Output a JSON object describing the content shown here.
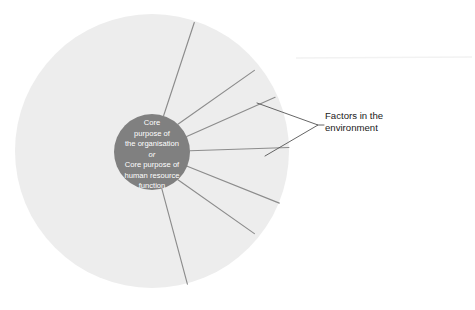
{
  "diagram": {
    "type": "radial-concept-diagram",
    "colors": {
      "outer_circle_fill": "#ededed",
      "inner_circle_fill": "#808080",
      "spoke_line": "#8c8c8c",
      "callout_line": "#555555",
      "core_text": "#ffffff",
      "label_text": "#1a1a1a",
      "background": "#ffffff",
      "artifact_line": "#f2f2f2"
    },
    "outer_circle": {
      "name": "environment-field",
      "cx": 152,
      "cy": 151,
      "r": 137
    },
    "inner_circle": {
      "name": "core-purpose-circle",
      "cx": 152,
      "cy": 152,
      "r": 38
    },
    "core_label": {
      "lines": [
        {
          "text": "Core",
          "italic": false
        },
        {
          "text": "purpose of",
          "italic": false
        },
        {
          "text": "the organisation",
          "italic": false
        },
        {
          "text": "or",
          "italic": true
        },
        {
          "text": "Core purpose of",
          "italic": false
        },
        {
          "text": "human resource",
          "italic": false
        },
        {
          "text": "function",
          "italic": false
        }
      ]
    },
    "spokes": [
      {
        "name": "spoke-1",
        "angle_deg": -72,
        "x1": 163.6,
        "y1": 115.8,
        "x2": 194.3,
        "y2": 22.5
      },
      {
        "name": "spoke-2",
        "angle_deg": -47,
        "x1": 177.9,
        "y1": 124.2,
        "x2": 254.4,
        "y2": 70.4
      },
      {
        "name": "spoke-3",
        "angle_deg": -24,
        "x1": 186.7,
        "y1": 136.5,
        "x2": 275.1,
        "y2": 97.3
      },
      {
        "name": "spoke-4",
        "angle_deg": -2,
        "x1": 190.0,
        "y1": 150.7,
        "x2": 288.9,
        "y2": 147.5
      },
      {
        "name": "spoke-5",
        "angle_deg": 22,
        "x1": 187.2,
        "y1": 166.2,
        "x2": 279.3,
        "y2": 203.1
      },
      {
        "name": "spoke-6",
        "angle_deg": 47,
        "x1": 177.9,
        "y1": 179.8,
        "x2": 254.4,
        "y2": 233.6
      },
      {
        "name": "spoke-7",
        "angle_deg": 75,
        "x1": 161.8,
        "y1": 188.7,
        "x2": 187.4,
        "y2": 284.2
      }
    ],
    "callout": {
      "name": "factors-callout",
      "bracket": {
        "tip_x": 318,
        "tip_y": 125,
        "upper_x": 257,
        "upper_y": 103,
        "lower_x": 265,
        "lower_y": 156
      },
      "label_lines": [
        "Factors in the",
        "environment"
      ],
      "label_x": 325,
      "label_y_first": 119,
      "label_line_height": 12
    },
    "artifact": {
      "name": "scan-artifact-line",
      "x1": 296,
      "y1": 58,
      "x2": 472,
      "y2": 57
    }
  }
}
